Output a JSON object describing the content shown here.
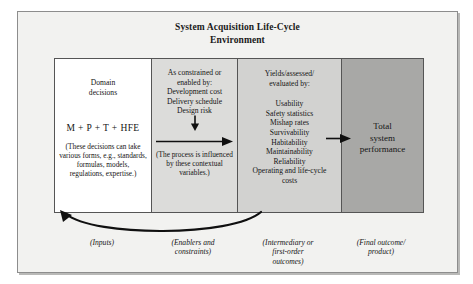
{
  "figure": {
    "title_line1": "System Acquisition Life-Cycle",
    "title_line2": "Environment"
  },
  "columns": {
    "domain": {
      "header_line1": "Domain",
      "header_line2": "decisions",
      "formula": "M + P + T + HFE",
      "note": "(These decisions can take various forms, e.g., standards, formulas, models, regulations, expertise.)",
      "caption": "(Inputs)",
      "background": "#ffffff"
    },
    "constraints": {
      "header": "As constrained or enabled by: Development cost Delivery schedule Design risk",
      "header_line1": "As constrained or",
      "header_line2": "enabled by:",
      "header_line3": "Development cost",
      "header_line4": "Delivery schedule",
      "header_line5": "Design risk",
      "note": "(The process is influenced by these contextual variables.)",
      "caption_line1": "(Enablers and",
      "caption_line2": "constraints)",
      "background": "#dcdcda"
    },
    "yields": {
      "header_line1": "Yields/assessed/",
      "header_line2": "evaluated by:",
      "metrics": [
        "Usability",
        "Safety statistics",
        "Mishap rates",
        "Survivability",
        "Habitability",
        "Maintainability",
        "Reliability",
        "Operating and life-cycle",
        "costs"
      ],
      "caption_line1": "(Intermediary or",
      "caption_line2": "first-order",
      "caption_line3": "outcomes)",
      "background": "#d2d2d0"
    },
    "total": {
      "label_line1": "Total",
      "label_line2": "system",
      "label_line3": "performance",
      "caption_line1": "(Final outcome/",
      "caption_line2": "product)",
      "background": "#a8a8a6"
    }
  },
  "arrows": {
    "down_arrow": "down-arrow",
    "flow_arrow": "right-arrow",
    "transfer_arrow": "right-arrow",
    "feedback_arrow": "feedback-curve-arrow"
  }
}
